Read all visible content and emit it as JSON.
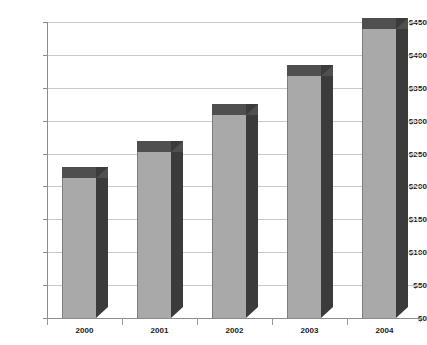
{
  "chart_data": {
    "type": "bar",
    "title": "",
    "subtitle": "",
    "xlabel": "",
    "ylabel": "",
    "categories": [
      "2000",
      "2001",
      "2002",
      "2003",
      "2004"
    ],
    "values": [
      213,
      253,
      308,
      368,
      440
    ],
    "ylim": [
      0,
      450
    ],
    "ytick_values": [
      0,
      50,
      100,
      150,
      200,
      250,
      300,
      350,
      400,
      450
    ],
    "ytick_labels": [
      "$0",
      "$50",
      "$100",
      "$150",
      "$200",
      "$250",
      "$300",
      "$350",
      "$400",
      "$450"
    ],
    "grid": true,
    "legend": false,
    "legend_position": "none",
    "style": "3d-column",
    "colors": {
      "bar_front": "#a9a9a9",
      "bar_side": "#3b3b3b",
      "bar_top": "#4f4f4f",
      "gridline": "#c9c9c9",
      "axis": "#8d8d8d",
      "text": "#1b1b1b",
      "background": "#ffffff"
    }
  }
}
